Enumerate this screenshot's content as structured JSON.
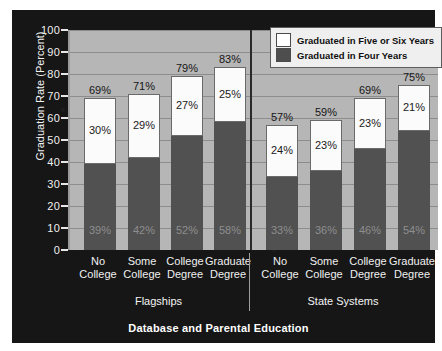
{
  "chart_data": {
    "type": "bar",
    "stacked": true,
    "title": "Database and Parental Education",
    "xlabel": "Database and Parental Education",
    "ylabel": "Graduation Rate (Percent)",
    "ylim": [
      0,
      100
    ],
    "yticks": [
      0,
      10,
      20,
      30,
      40,
      50,
      60,
      70,
      80,
      90,
      100
    ],
    "grid": true,
    "legend_position": "top-right",
    "legend": [
      "Graduated in Five or Six Years",
      "Graduated in Four Years"
    ],
    "colors": {
      "four_years": "#515151",
      "five_or_six_years": "#fbfbfb",
      "plot_background": "#b6b6b6",
      "panel_background": "#161616",
      "gridline": "#8d8d8d"
    },
    "groups": [
      {
        "name": "Flagships",
        "categories": [
          "No College",
          "Some College",
          "College Degree",
          "Graduate Degree"
        ],
        "series": [
          {
            "name": "Graduated in Four Years",
            "values": [
              39,
              42,
              52,
              58
            ]
          },
          {
            "name": "Graduated in Five or Six Years",
            "values": [
              30,
              29,
              27,
              25
            ]
          }
        ],
        "totals": [
          69,
          71,
          79,
          83
        ]
      },
      {
        "name": "State Systems",
        "categories": [
          "No College",
          "Some College",
          "College Degree",
          "Graduate Degree"
        ],
        "series": [
          {
            "name": "Graduated in Four Years",
            "values": [
              33,
              36,
              46,
              54
            ]
          },
          {
            "name": "Graduated in Five or Six Years",
            "values": [
              24,
              23,
              23,
              21
            ]
          }
        ],
        "totals": [
          57,
          59,
          69,
          75
        ]
      }
    ],
    "bars": [
      {
        "group": "Flagships",
        "category": "No College",
        "line1": "No",
        "line2": "College",
        "four": 39,
        "five": 30,
        "total": 69,
        "four_label": "39%",
        "five_label": "30%",
        "total_label": "69%"
      },
      {
        "group": "Flagships",
        "category": "Some College",
        "line1": "Some",
        "line2": "College",
        "four": 42,
        "five": 29,
        "total": 71,
        "four_label": "42%",
        "five_label": "29%",
        "total_label": "71%"
      },
      {
        "group": "Flagships",
        "category": "College Degree",
        "line1": "College",
        "line2": "Degree",
        "four": 52,
        "five": 27,
        "total": 79,
        "four_label": "52%",
        "five_label": "27%",
        "total_label": "79%"
      },
      {
        "group": "Flagships",
        "category": "Graduate Degree",
        "line1": "Graduate",
        "line2": "Degree",
        "four": 58,
        "five": 25,
        "total": 83,
        "four_label": "58%",
        "five_label": "25%",
        "total_label": "83%"
      },
      {
        "group": "State Systems",
        "category": "No College",
        "line1": "No",
        "line2": "College",
        "four": 33,
        "five": 24,
        "total": 57,
        "four_label": "33%",
        "five_label": "24%",
        "total_label": "57%"
      },
      {
        "group": "State Systems",
        "category": "Some College",
        "line1": "Some",
        "line2": "College",
        "four": 36,
        "five": 23,
        "total": 59,
        "four_label": "36%",
        "five_label": "23%",
        "total_label": "59%"
      },
      {
        "group": "State Systems",
        "category": "College Degree",
        "line1": "College",
        "line2": "Degree",
        "four": 46,
        "five": 23,
        "total": 69,
        "four_label": "46%",
        "five_label": "23%",
        "total_label": "69%"
      },
      {
        "group": "State Systems",
        "category": "Graduate Degree",
        "line1": "Graduate",
        "line2": "Degree",
        "four": 54,
        "five": 21,
        "total": 75,
        "four_label": "54%",
        "five_label": "21%",
        "total_label": "75%"
      }
    ]
  },
  "yaxis": {
    "label": "Graduation Rate (Percent)",
    "ticks": [
      "100",
      "90",
      "80",
      "70",
      "60",
      "50",
      "40",
      "30",
      "20",
      "10",
      "0"
    ]
  },
  "legend": {
    "items": [
      {
        "label": "Graduated in Five or Six Years",
        "swatch": "white"
      },
      {
        "label": "Graduated in Four Years",
        "swatch": "dark"
      }
    ]
  },
  "groups": [
    {
      "label": "Flagships"
    },
    {
      "label": "State Systems"
    }
  ],
  "caption": {
    "text": "Database and Parental Education"
  }
}
